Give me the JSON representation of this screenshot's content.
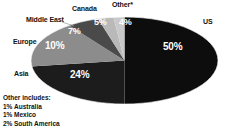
{
  "chart_data": {
    "type": "pie",
    "title": "",
    "categories": [
      "US",
      "Asia",
      "Europe",
      "Middle East",
      "Canada",
      "Other*"
    ],
    "values": [
      50,
      24,
      10,
      7,
      5,
      4
    ],
    "value_labels": [
      "50%",
      "24%",
      "10%",
      "7%",
      "5%",
      "4%"
    ],
    "unit": "%",
    "legend_position": "callout-labels",
    "grid": false,
    "slices": [
      {
        "label": "US",
        "value": 50,
        "value_label": "50%",
        "color": "#0d0d0d"
      },
      {
        "label": "Asia",
        "value": 24,
        "value_label": "24%",
        "color": "#1c1c1c"
      },
      {
        "label": "Europe",
        "value": 10,
        "value_label": "10%",
        "color": "#8c8c8c"
      },
      {
        "label": "Middle East",
        "value": 7,
        "value_label": "7%",
        "color": "#4a4a4a"
      },
      {
        "label": "Canada",
        "value": 5,
        "value_label": "5%",
        "color": "#b9b9b9"
      },
      {
        "label": "Other*",
        "value": 4,
        "value_label": "4%",
        "color": "#c9c9c9"
      }
    ],
    "footnote": {
      "title": "Other includes:",
      "items": [
        {
          "pct": "1%",
          "name": "Australia"
        },
        {
          "pct": "1%",
          "name": "Mexico"
        },
        {
          "pct": "2%",
          "name": "South America"
        }
      ]
    }
  },
  "labels": {
    "us": "US",
    "asia": "Asia",
    "europe": "Europe",
    "middle_east": "Middle East",
    "canada": "Canada",
    "other": "Other*"
  },
  "percents": {
    "us": "50%",
    "asia": "24%",
    "europe": "10%",
    "middle_east": "7%",
    "canada": "5%",
    "other": "4%"
  },
  "footnote": {
    "title": "Other includes:",
    "row1_pct": "1%",
    "row1_name": "Australia",
    "row2_pct": "1%",
    "row2_name": "Mexico",
    "row3_pct": "2%",
    "row3_name": "South America"
  },
  "colors": {
    "us": "#0d0d0d",
    "asia": "#1c1c1c",
    "europe": "#8c8c8c",
    "middle_east": "#4a4a4a",
    "canada": "#b9b9b9",
    "other": "#c9c9c9",
    "text": "#111111",
    "value_text": "#ffffff",
    "background": "#ffffff"
  }
}
